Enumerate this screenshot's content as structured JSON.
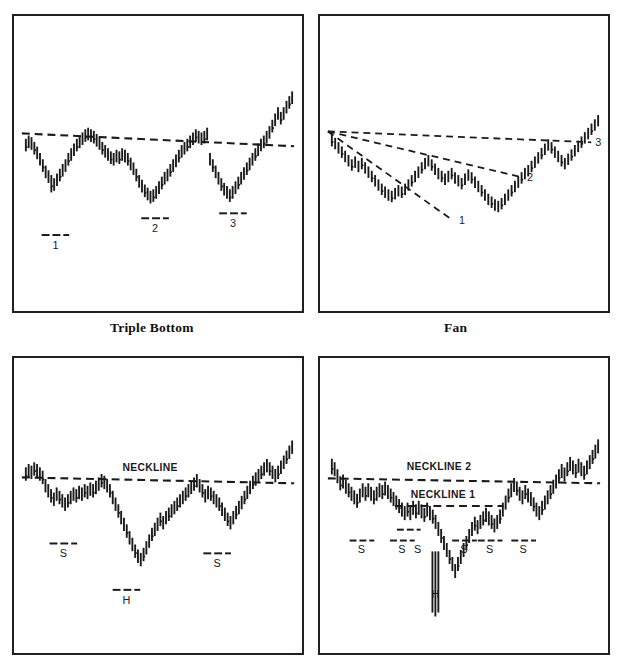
{
  "figure": {
    "background": "#ffffff",
    "ink_color": "#1a1a1a",
    "panel_border_color": "#231f20"
  },
  "panels": [
    {
      "id": "triple-bottom",
      "caption": "Triple Bottom",
      "labels": [
        "1",
        "2",
        "3"
      ],
      "trendline_label": ""
    },
    {
      "id": "fan",
      "caption": "Fan",
      "labels": [
        "1",
        "2",
        "3"
      ],
      "trendline_label": ""
    },
    {
      "id": "head-and-shoulders",
      "caption": "",
      "labels": [
        "S",
        "H",
        "S"
      ],
      "neckline_labels": [
        "NECKLINE"
      ]
    },
    {
      "id": "complex-head-and-shoulders",
      "caption": "",
      "labels": [
        "S",
        "S",
        "S",
        "H",
        "S",
        "S",
        "S"
      ],
      "neckline_labels": [
        "NECKLINE 2",
        "NECKLINE 1"
      ]
    }
  ],
  "captions": {
    "triple_bottom": "Triple Bottom",
    "fan": "Fan"
  },
  "annotations": {
    "triple_bottom": {
      "bottom_1": "1",
      "bottom_2": "2",
      "bottom_3": "3"
    },
    "fan": {
      "line_1": "1",
      "line_2": "2",
      "line_3": "3"
    },
    "head_shoulders": {
      "neckline": "NECKLINE",
      "left_shoulder": "S",
      "head": "H",
      "right_shoulder": "S"
    },
    "complex_head_shoulders": {
      "neckline_2": "NECKLINE 2",
      "neckline_1": "NECKLINE 1",
      "shoulder_1": "S",
      "shoulder_2": "S",
      "shoulder_3": "S",
      "head": "H",
      "shoulder_4": "S",
      "shoulder_5": "S",
      "shoulder_6": "S"
    }
  },
  "chart_data": [
    {
      "id": "triple-bottom",
      "type": "line",
      "title": "Triple Bottom",
      "xlabel": "",
      "ylabel": "",
      "grid": false,
      "legend": "none",
      "ylim": [
        0,
        100
      ],
      "note": "OHLC bar series forming three equal lows under a flat dashed resistance trendline",
      "trendline": {
        "style": "dashed",
        "x": [
          2,
          98
        ],
        "y": [
          72,
          66
        ]
      },
      "markers": [
        {
          "label": "1",
          "x": 12.5,
          "y": 14
        },
        {
          "label": "2",
          "x": 46.0,
          "y": 19
        },
        {
          "label": "3",
          "x": 72.5,
          "y": 20
        }
      ],
      "series": [
        {
          "name": "high",
          "values": [
            66,
            68,
            67,
            64,
            61,
            57,
            53,
            49,
            46,
            43,
            41,
            44,
            47,
            50,
            53,
            57,
            60,
            63,
            66,
            68,
            70,
            72,
            73,
            72,
            71,
            69,
            67,
            64,
            62,
            60,
            58,
            57,
            59,
            58,
            60,
            59,
            57,
            54,
            51,
            47,
            43,
            40,
            37,
            35,
            33,
            34,
            36,
            39,
            42,
            45,
            47,
            50,
            53,
            56,
            59,
            62,
            64,
            66,
            68,
            70,
            72,
            71,
            70,
            71,
            73,
            57,
            53,
            49,
            45,
            41,
            38,
            36,
            34,
            36,
            39,
            42,
            45,
            48,
            51,
            54,
            57,
            60,
            63,
            66,
            68,
            71,
            74,
            78,
            82,
            86,
            83,
            86,
            90,
            93,
            96
          ]
        },
        {
          "name": "low",
          "values": [
            58,
            60,
            59,
            56,
            53,
            49,
            45,
            41,
            38,
            32,
            33,
            36,
            39,
            42,
            45,
            49,
            52,
            55,
            58,
            60,
            62,
            64,
            65,
            64,
            63,
            61,
            59,
            56,
            54,
            52,
            50,
            49,
            51,
            50,
            52,
            51,
            49,
            46,
            43,
            39,
            35,
            32,
            29,
            27,
            25,
            26,
            28,
            31,
            34,
            37,
            39,
            42,
            45,
            48,
            51,
            54,
            56,
            58,
            60,
            62,
            64,
            63,
            62,
            63,
            65,
            49,
            45,
            41,
            37,
            33,
            30,
            28,
            26,
            28,
            31,
            34,
            37,
            40,
            43,
            46,
            49,
            52,
            55,
            58,
            60,
            63,
            66,
            70,
            74,
            78,
            75,
            78,
            82,
            85,
            88
          ]
        }
      ]
    },
    {
      "id": "fan",
      "type": "line",
      "title": "Fan",
      "xlabel": "",
      "ylabel": "",
      "grid": false,
      "legend": "none",
      "ylim": [
        0,
        100
      ],
      "note": "Three dashed fan trendlines radiating from a single origin at the upper-left over a declining then recovering OHLC series",
      "fan_origin": {
        "x": 1.5,
        "y": 72
      },
      "fanlines": [
        {
          "label": "1",
          "end_x": 44,
          "end_y": 16
        },
        {
          "label": "2",
          "end_x": 68,
          "end_y": 40
        },
        {
          "label": "3",
          "end_x": 97,
          "end_y": 67
        }
      ],
      "series": [
        {
          "name": "high",
          "values": [
            73,
            70,
            67,
            64,
            61,
            58,
            55,
            57,
            54,
            56,
            53,
            50,
            47,
            44,
            41,
            38,
            36,
            34,
            33,
            35,
            37,
            36,
            38,
            41,
            44,
            47,
            50,
            53,
            56,
            58,
            55,
            52,
            49,
            47,
            45,
            47,
            49,
            46,
            44,
            42,
            45,
            48,
            46,
            43,
            40,
            37,
            34,
            31,
            29,
            27,
            26,
            28,
            31,
            34,
            37,
            40,
            43,
            46,
            49,
            51,
            54,
            57,
            60,
            63,
            66,
            69,
            67,
            64,
            61,
            58,
            56,
            59,
            62,
            65,
            68,
            71,
            74,
            77,
            80,
            83,
            86
          ]
        },
        {
          "name": "low",
          "values": [
            64,
            62,
            59,
            56,
            53,
            50,
            47,
            49,
            46,
            48,
            45,
            42,
            39,
            36,
            33,
            30,
            28,
            26,
            25,
            27,
            29,
            28,
            30,
            33,
            36,
            39,
            42,
            45,
            48,
            50,
            47,
            44,
            41,
            39,
            37,
            39,
            41,
            38,
            36,
            34,
            37,
            40,
            38,
            35,
            32,
            29,
            26,
            23,
            21,
            19,
            18,
            20,
            23,
            26,
            29,
            32,
            35,
            38,
            41,
            43,
            46,
            49,
            52,
            55,
            58,
            61,
            59,
            56,
            53,
            50,
            48,
            51,
            54,
            57,
            60,
            63,
            66,
            69,
            72,
            75,
            78
          ]
        }
      ]
    },
    {
      "id": "head-and-shoulders",
      "type": "line",
      "title": "Head and Shoulders Bottom",
      "xlabel": "",
      "ylabel": "",
      "grid": false,
      "legend": "none",
      "ylim": [
        0,
        100
      ],
      "note": "Inverted head-and-shoulders with a single dashed neckline; left shoulder S, head H, right shoulder S",
      "neckline": {
        "label": "NECKLINE",
        "style": "dashed",
        "x": [
          2,
          98
        ],
        "y": [
          72,
          69
        ]
      },
      "markers": [
        {
          "label": "S",
          "x": 13,
          "y": 30
        },
        {
          "label": "H",
          "x": 42.5,
          "y": 12
        },
        {
          "label": "S",
          "x": 71,
          "y": 26
        }
      ],
      "series": [
        {
          "name": "high",
          "values": [
            76,
            78,
            77,
            79,
            78,
            76,
            74,
            69,
            66,
            63,
            61,
            64,
            62,
            60,
            58,
            60,
            62,
            64,
            63,
            65,
            64,
            66,
            65,
            67,
            66,
            68,
            70,
            72,
            71,
            69,
            66,
            62,
            58,
            54,
            50,
            46,
            42,
            38,
            34,
            30,
            27,
            25,
            28,
            32,
            36,
            40,
            43,
            46,
            49,
            47,
            50,
            52,
            54,
            56,
            58,
            60,
            62,
            64,
            66,
            68,
            70,
            72,
            69,
            66,
            63,
            65,
            64,
            62,
            60,
            58,
            55,
            52,
            49,
            47,
            50,
            53,
            56,
            59,
            62,
            65,
            68,
            71,
            73,
            75,
            77,
            79,
            81,
            79,
            77,
            75,
            77,
            80,
            83,
            86,
            89,
            92
          ]
        },
        {
          "name": "low",
          "values": [
            68,
            70,
            69,
            71,
            70,
            68,
            66,
            61,
            58,
            55,
            53,
            56,
            54,
            52,
            50,
            52,
            54,
            56,
            55,
            57,
            56,
            58,
            57,
            59,
            58,
            60,
            62,
            64,
            63,
            61,
            58,
            54,
            50,
            46,
            42,
            38,
            34,
            30,
            26,
            22,
            19,
            17,
            20,
            24,
            28,
            32,
            35,
            38,
            41,
            39,
            42,
            44,
            46,
            48,
            50,
            52,
            54,
            56,
            58,
            60,
            62,
            64,
            61,
            58,
            55,
            57,
            56,
            54,
            52,
            50,
            47,
            44,
            41,
            39,
            42,
            45,
            48,
            51,
            54,
            57,
            60,
            63,
            65,
            67,
            69,
            71,
            73,
            71,
            69,
            67,
            69,
            72,
            75,
            78,
            81,
            84
          ]
        }
      ]
    },
    {
      "id": "complex-head-and-shoulders",
      "type": "line",
      "title": "Complex Head and Shoulders Bottom",
      "xlabel": "",
      "ylabel": "",
      "grid": false,
      "legend": "none",
      "ylim": [
        0,
        100
      ],
      "note": "Complex inverted head-and-shoulders with two dashed necklines and six shoulder lows plus one head low",
      "necklines": [
        {
          "label": "NECKLINE 2",
          "style": "dashed",
          "x": [
            2,
            98
          ],
          "y": [
            71,
            69
          ]
        },
        {
          "label": "NECKLINE 1",
          "style": "dashed",
          "x": [
            26,
            63
          ],
          "y": [
            52,
            52
          ]
        }
      ],
      "markers": [
        {
          "label": "S",
          "x": 10,
          "y": 31
        },
        {
          "label": "S",
          "x": 27,
          "y": 31
        },
        {
          "label": "S",
          "x": 33,
          "y": 31
        },
        {
          "label": "H",
          "x": 42,
          "y": 8
        },
        {
          "label": "S",
          "x": 52,
          "y": 31
        },
        {
          "label": "S",
          "x": 60,
          "y": 31
        },
        {
          "label": "S",
          "x": 70,
          "y": 31
        }
      ],
      "series": [
        {
          "name": "high",
          "values": [
            82,
            80,
            76,
            72,
            73,
            70,
            68,
            66,
            64,
            62,
            65,
            68,
            66,
            68,
            66,
            64,
            66,
            68,
            67,
            69,
            67,
            65,
            63,
            61,
            59,
            57,
            55,
            57,
            55,
            58,
            56,
            58,
            56,
            54,
            57,
            55,
            53,
            50,
            46,
            42,
            38,
            34,
            30,
            26,
            22,
            26,
            30,
            34,
            38,
            42,
            46,
            49,
            47,
            50,
            52,
            54,
            52,
            50,
            48,
            50,
            53,
            57,
            61,
            65,
            68,
            71,
            69,
            66,
            64,
            67,
            65,
            63,
            60,
            57,
            55,
            58,
            61,
            64,
            67,
            70,
            73,
            76,
            79,
            77,
            80,
            83,
            81,
            79,
            82,
            80,
            78,
            81,
            84,
            87,
            90,
            93
          ]
        },
        {
          "name": "low",
          "values": [
            73,
            72,
            68,
            64,
            65,
            62,
            60,
            58,
            56,
            54,
            57,
            60,
            58,
            60,
            58,
            56,
            58,
            60,
            59,
            61,
            59,
            57,
            55,
            53,
            51,
            49,
            47,
            49,
            47,
            50,
            48,
            50,
            48,
            46,
            49,
            47,
            45,
            42,
            38,
            34,
            30,
            26,
            22,
            18,
            14,
            18,
            22,
            26,
            30,
            34,
            38,
            41,
            39,
            42,
            44,
            46,
            44,
            42,
            40,
            42,
            45,
            49,
            53,
            57,
            60,
            63,
            61,
            58,
            56,
            59,
            57,
            55,
            52,
            49,
            47,
            50,
            53,
            56,
            59,
            62,
            65,
            68,
            71,
            69,
            72,
            75,
            73,
            71,
            74,
            72,
            70,
            73,
            76,
            79,
            82,
            85
          ]
        }
      ]
    }
  ]
}
